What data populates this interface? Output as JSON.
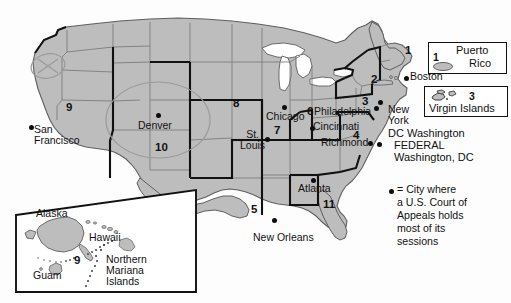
{
  "figure": {
    "kind": "map",
    "colors": {
      "land_fill": "#bdbdbd",
      "ocean_fill": "#ffffff",
      "state_border": "#6e6e6e",
      "circuit_border": "#111111",
      "text": "#111111",
      "annotation_pen": "#8d8d8d"
    }
  },
  "cities": [
    {
      "name": "San\nFrancisco",
      "line1": "San",
      "line2": "Francisco"
    },
    {
      "name": "Denver",
      "line1": "Denver",
      "line2": ""
    },
    {
      "name": "St.\nLouis",
      "line1": "St.",
      "line2": "Louis"
    },
    {
      "name": "Chicago",
      "line1": "Chicago",
      "line2": ""
    },
    {
      "name": "Cincinnati",
      "line1": "Cincinnati",
      "line2": ""
    },
    {
      "name": "Philadelphia",
      "line1": "Philadelphia",
      "line2": ""
    },
    {
      "name": "Boston",
      "line1": "Boston",
      "line2": ""
    },
    {
      "name": "New\nYork",
      "line1": "New",
      "line2": "York"
    },
    {
      "name": "Richmond",
      "line1": "Richmond",
      "line2": ""
    },
    {
      "name": "Atlanta",
      "line1": "Atlanta",
      "line2": ""
    },
    {
      "name": "New Orleans",
      "line1": "New Orleans",
      "line2": ""
    }
  ],
  "city_labels": {
    "san_francisco_l1": "San",
    "san_francisco_l2": "Francisco",
    "denver": "Denver",
    "st_louis_l1": "St.",
    "st_louis_l2": "Louis",
    "chicago": "Chicago",
    "cincinnati": "Cincinnati",
    "philadelphia": "Philadelphia",
    "boston": "Boston",
    "new_york_l1": "New",
    "new_york_l2": "York",
    "richmond": "Richmond",
    "atlanta": "Atlanta",
    "new_orleans": "New Orleans",
    "dc_washington": "DC Washington",
    "federal": "FEDERAL",
    "federal_sub": "Washington, DC"
  },
  "circuit_numbers": {
    "c1": "1",
    "c2": "2",
    "c3": "3",
    "c4": "4",
    "c5": "5",
    "c6": "6",
    "c7": "7",
    "c8": "8",
    "c9_west": "9",
    "c9_inset": "9",
    "c10": "10",
    "c11": "11"
  },
  "legend_boxes": [
    {
      "id": "puerto-rico",
      "number": "1",
      "line1": "Puerto",
      "line2": "Rico"
    },
    {
      "id": "virgin-islands",
      "number": "3",
      "line1": "Virgin Islands",
      "line2": ""
    }
  ],
  "legend_key": {
    "symbol": "●",
    "line1": "= City where",
    "line2": "a U.S. Court of",
    "line3": "Appeals holds",
    "line4": "most of its",
    "line5": "sessions"
  },
  "inset": {
    "labels": {
      "alaska": "Alaska",
      "hawaii": "Hawaii",
      "guam": "Guam",
      "nmi_l1": "Northern",
      "nmi_l2": "Mariana",
      "nmi_l3": "Islands",
      "circuit": "9"
    }
  },
  "annotations": [
    {
      "id": "oregon-x-mark",
      "type": "ellipse-with-x",
      "note": "hand-drawn ellipse crossed out over Oregon"
    },
    {
      "id": "colorado-circle",
      "type": "ellipse",
      "note": "hand-drawn circle around Denver / Colorado region"
    }
  ]
}
